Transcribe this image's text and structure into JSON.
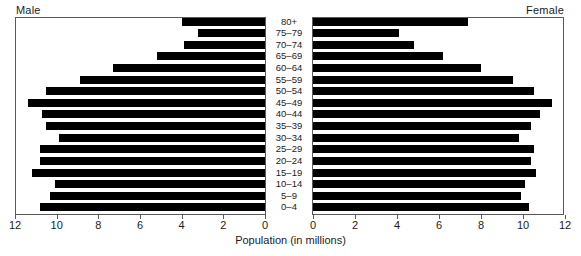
{
  "chart_title": "Canada: Census 2011",
  "male_label": "Male",
  "female_label": "Female",
  "axis_caption": "Population (in millions)",
  "left_ticks": [
    "12",
    "10",
    "8",
    "6",
    "4",
    "2",
    "0"
  ],
  "right_ticks": [
    "0",
    "2",
    "4",
    "6",
    "8",
    "10",
    "12"
  ],
  "colors": {
    "bar": "#000000",
    "frame": "#5a5a5a",
    "text": "#1b1b1b",
    "background": "#ffffff"
  },
  "chart_data": {
    "type": "bar",
    "title": "Canada: Census 2011",
    "subtype": "population-pyramid",
    "xlabel": "Population (in millions)",
    "ylabel": "",
    "xlim": [
      0,
      12
    ],
    "grid": false,
    "legend_position": "none",
    "categories": [
      "80+",
      "75–79",
      "70–74",
      "65–69",
      "60–64",
      "55–59",
      "50–54",
      "45–49",
      "40–44",
      "35–39",
      "30–34",
      "25–29",
      "20–24",
      "15–19",
      "10–14",
      "5–9",
      "0–4"
    ],
    "series": [
      {
        "name": "Male",
        "direction": "left",
        "values": [
          4.0,
          3.2,
          3.9,
          5.2,
          7.3,
          8.9,
          10.5,
          11.4,
          10.7,
          10.5,
          9.9,
          10.8,
          10.8,
          11.2,
          10.1,
          10.3,
          10.8
        ]
      },
      {
        "name": "Female",
        "direction": "right",
        "values": [
          7.4,
          4.1,
          4.8,
          6.2,
          8.0,
          9.5,
          10.5,
          11.4,
          10.8,
          10.4,
          9.8,
          10.5,
          10.4,
          10.6,
          10.1,
          9.9,
          10.3
        ]
      }
    ]
  }
}
